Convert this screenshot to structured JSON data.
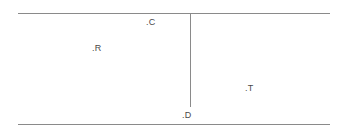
{
  "diagram": {
    "background_color": "#ffffff",
    "stroke_color": "#8a8a8a",
    "label_color": "#4a4a4a",
    "labels": [
      {
        "id": "c",
        "text": ".C"
      },
      {
        "id": "r",
        "text": ".R"
      },
      {
        "id": "t",
        "text": ".T"
      },
      {
        "id": "d",
        "text": ".D"
      }
    ]
  }
}
